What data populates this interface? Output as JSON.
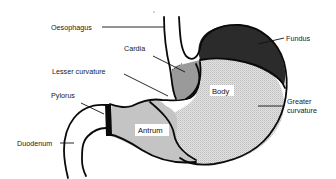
{
  "diagram": {
    "type": "anatomical-diagram",
    "labels": {
      "oesophagus": "Oesophagus",
      "cardia": "Cardia",
      "lesser_curvature": "Lesser curvature",
      "pylorus": "Pylorus",
      "duodenum": "Duodenum",
      "fundus": "Fundus",
      "body": "Body",
      "greater_curvature_line1": "Greater",
      "greater_curvature_line2": "curvature",
      "antrum": "Antrum"
    },
    "regions": [
      {
        "name": "Fundus",
        "fill": "#2b2b2b"
      },
      {
        "name": "Cardia",
        "fill": "#9a9a9a"
      },
      {
        "name": "Body",
        "fill": "#dcdcdc",
        "pattern": "stippled"
      },
      {
        "name": "Antrum",
        "fill": "#c4c4c4"
      }
    ],
    "colors": {
      "outline": "#0a0a0a",
      "background": "#ffffff"
    }
  }
}
